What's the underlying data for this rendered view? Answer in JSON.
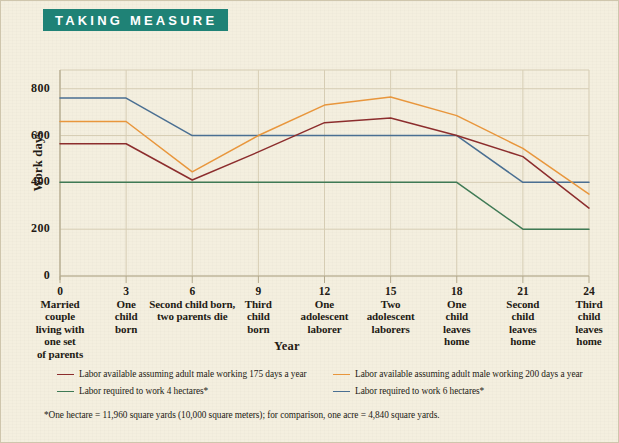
{
  "banner": {
    "title": "TAKING MEASURE"
  },
  "axes": {
    "ylabel": "Work days",
    "xlabel": "Year",
    "yticks": [
      "0",
      "200",
      "400",
      "600",
      "800"
    ],
    "ymin": 0,
    "ymax": 880,
    "xmin": 0,
    "xmax": 24
  },
  "xaxis": {
    "ticks": [
      {
        "value": "0",
        "caption": "Married\ncouple\nliving with\none set\nof parents"
      },
      {
        "value": "3",
        "caption": "One\nchild\nborn"
      },
      {
        "value": "6",
        "caption": "Second child born,\ntwo parents die"
      },
      {
        "value": "9",
        "caption": "Third\nchild\nborn"
      },
      {
        "value": "12",
        "caption": "One\nadolescent\nlaborer"
      },
      {
        "value": "15",
        "caption": "Two\nadolescent\nlaborers"
      },
      {
        "value": "18",
        "caption": "One\nchild\nleaves\nhome"
      },
      {
        "value": "21",
        "caption": "Second\nchild\nleaves\nhome"
      },
      {
        "value": "24",
        "caption": "Third\nchild\nleaves\nhome"
      }
    ]
  },
  "legend": [
    {
      "label": "Labor available assuming adult male working 175 days a year",
      "color": "#8c2d2d"
    },
    {
      "label": "Labor available assuming adult male working 200 days a year",
      "color": "#e8963c"
    },
    {
      "label": "Labor required to work 4 hectares*",
      "color": "#3f7a55"
    },
    {
      "label": "Labor required to work 6 hectares*",
      "color": "#4a6f92"
    }
  ],
  "footnote": "*One hectare = 11,960 square yards (10,000 square meters); for comparison, one acre = 4,840 square yards.",
  "colors": {
    "banner_bg": "#1f8276",
    "paper": "#f4efdf",
    "grid": "#d6cdb4",
    "axis": "#b3a98d"
  },
  "chart_data": {
    "type": "line",
    "title": "TAKING MEASURE",
    "xlabel": "Year",
    "ylabel": "Work days",
    "x": [
      0,
      3,
      6,
      9,
      12,
      15,
      18,
      21,
      24
    ],
    "xlim": [
      0,
      24
    ],
    "ylim": [
      0,
      880
    ],
    "yticks": [
      0,
      200,
      400,
      600,
      800
    ],
    "grid": true,
    "legend_position": "below-plot",
    "x_tick_captions": [
      "Married couple living with one set of parents",
      "One child born",
      "Second child born, two parents die",
      "Third child born",
      "One adolescent laborer",
      "Two adolescent laborers",
      "One child leaves home",
      "Second child leaves home",
      "Third child leaves home"
    ],
    "series": [
      {
        "name": "Labor available assuming adult male working 175 days a year",
        "color": "#8c2d2d",
        "values": [
          565,
          565,
          410,
          530,
          655,
          675,
          600,
          510,
          290
        ]
      },
      {
        "name": "Labor available assuming adult male working 200 days a year",
        "color": "#e8963c",
        "values": [
          660,
          660,
          445,
          600,
          730,
          765,
          685,
          545,
          350
        ]
      },
      {
        "name": "Labor required to work 4 hectares*",
        "color": "#3f7a55",
        "values": [
          400,
          400,
          400,
          400,
          400,
          400,
          400,
          200,
          200
        ]
      },
      {
        "name": "Labor required to work 6 hectares*",
        "color": "#4a6f92",
        "values": [
          760,
          760,
          600,
          600,
          600,
          600,
          600,
          400,
          400
        ]
      }
    ]
  }
}
